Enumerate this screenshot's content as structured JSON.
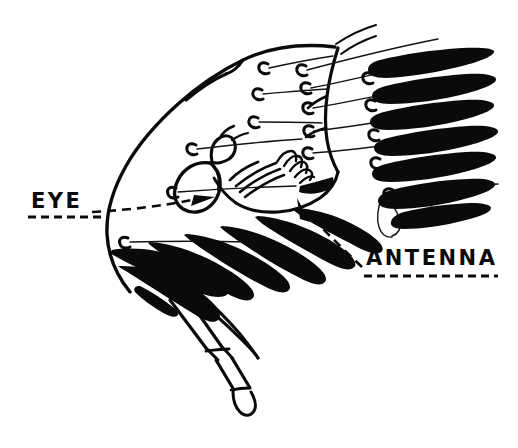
{
  "figure": {
    "background_color": "#ffffff",
    "ink_color": "#0a0a0a",
    "width": 518,
    "height": 448
  },
  "labels": {
    "eye": {
      "text": "EYE",
      "x": 31,
      "y": 191,
      "underline": true,
      "leader": "dashed-arrow-right"
    },
    "antenna": {
      "text": "ANTENNA",
      "x": 366,
      "y": 248,
      "underline": true,
      "leader": "dashed-arrow-up-left"
    }
  },
  "parts": [
    {
      "name": "carapace",
      "description": "large rounded body outline"
    },
    {
      "name": "eye",
      "description": "oval compound eye outline"
    },
    {
      "name": "mouthparts",
      "description": "finger-like maxilliped lobes"
    },
    {
      "name": "antennule",
      "description": "segmented tail-like appendage"
    },
    {
      "name": "pleopods",
      "description": "dark feathery swimmerets"
    },
    {
      "name": "setae",
      "description": "long thin bristles from appendage bases"
    }
  ]
}
